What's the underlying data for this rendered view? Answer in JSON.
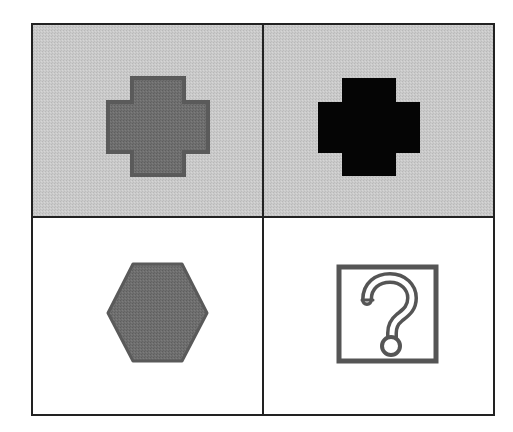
{
  "puzzle": {
    "title": "",
    "grid": {
      "rows": 2,
      "cols": 2
    },
    "colors": {
      "shaded_background": "#c8c8c8",
      "white_background": "#ffffff",
      "border": "#222222",
      "gray_shape_fill": "#6e6e6e",
      "gray_shape_stroke": "#5a5a5a",
      "black_shape_fill": "#000000",
      "question_stroke": "#555555"
    },
    "cells": [
      {
        "position": "top-left",
        "shape": "cross",
        "fill": "gray",
        "background": "shaded"
      },
      {
        "position": "top-right",
        "shape": "cross",
        "fill": "black",
        "background": "shaded"
      },
      {
        "position": "bottom-left",
        "shape": "hexagon",
        "fill": "gray",
        "background": "white"
      },
      {
        "position": "bottom-right",
        "shape": "question-mark-box",
        "fill": "none",
        "background": "white",
        "label": "?"
      }
    ]
  }
}
